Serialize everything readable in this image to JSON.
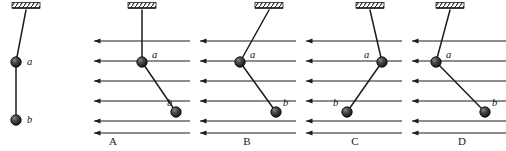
{
  "figure": {
    "type": "physics-diagram",
    "stroke_color": "#1d1d1d",
    "ball_color": "#2b2b2b",
    "ball_radius": 5.2,
    "field_arrow_color": "#1d1d1d"
  },
  "reference": {
    "name": "reference-figure",
    "ceiling": {
      "x1": 12,
      "x2": 40,
      "y": 8
    },
    "string_points": [
      [
        26,
        10
      ],
      [
        16,
        62
      ],
      [
        16,
        120
      ]
    ],
    "balls": [
      {
        "id": "a",
        "label": "a",
        "cx": 16,
        "cy": 62,
        "label_x": 27,
        "label_y": 57
      },
      {
        "id": "b",
        "label": "b",
        "cx": 16,
        "cy": 120,
        "label_x": 27,
        "label_y": 115
      }
    ]
  },
  "field": {
    "line_count": 6,
    "direction": "left",
    "rows_y": [
      41,
      61,
      81,
      101,
      121,
      133
    ]
  },
  "panels": [
    {
      "id": "A",
      "label": "A",
      "label_x": 93,
      "label_y": 136,
      "ceiling": {
        "x1": 128,
        "x2": 156,
        "y": 8
      },
      "string_points": [
        [
          142,
          10
        ],
        [
          142,
          62
        ],
        [
          176,
          112
        ]
      ],
      "balls": [
        {
          "id": "a",
          "label": "a",
          "cx": 142,
          "cy": 62,
          "label_x": 152,
          "label_y": 50
        },
        {
          "id": "b",
          "label": "b",
          "cx": 176,
          "cy": 112,
          "label_x": 167,
          "label_y": 98
        }
      ],
      "field_rows": [
        {
          "y": 41,
          "x_left": 88,
          "x_right": 190
        },
        {
          "y": 61,
          "x_left": 88,
          "x_right": 190
        },
        {
          "y": 81,
          "x_left": 88,
          "x_right": 190
        },
        {
          "y": 101,
          "x_left": 88,
          "x_right": 190
        },
        {
          "y": 121,
          "x_left": 88,
          "x_right": 190
        },
        {
          "y": 133,
          "x_left": 88,
          "x_right": 190
        }
      ]
    },
    {
      "id": "B",
      "label": "B",
      "label_x": 227,
      "label_y": 136,
      "ceiling": {
        "x1": 255,
        "x2": 283,
        "y": 8
      },
      "string_points": [
        [
          269,
          10
        ],
        [
          240,
          62
        ],
        [
          276,
          112
        ]
      ],
      "balls": [
        {
          "id": "a",
          "label": "a",
          "cx": 240,
          "cy": 62,
          "label_x": 250,
          "label_y": 50
        },
        {
          "id": "b",
          "label": "b",
          "cx": 276,
          "cy": 112,
          "label_x": 283,
          "label_y": 98
        }
      ],
      "field_rows": [
        {
          "y": 41,
          "x_left": 194,
          "x_right": 296
        },
        {
          "y": 61,
          "x_left": 194,
          "x_right": 296
        },
        {
          "y": 81,
          "x_left": 194,
          "x_right": 296
        },
        {
          "y": 101,
          "x_left": 194,
          "x_right": 296
        },
        {
          "y": 121,
          "x_left": 194,
          "x_right": 296
        },
        {
          "y": 133,
          "x_left": 194,
          "x_right": 296
        }
      ]
    },
    {
      "id": "C",
      "label": "C",
      "label_x": 335,
      "label_y": 136,
      "ceiling": {
        "x1": 356,
        "x2": 384,
        "y": 8
      },
      "string_points": [
        [
          370,
          10
        ],
        [
          382,
          62
        ],
        [
          347,
          112
        ]
      ],
      "balls": [
        {
          "id": "a",
          "label": "a",
          "cx": 382,
          "cy": 62,
          "label_x": 364,
          "label_y": 50
        },
        {
          "id": "b",
          "label": "b",
          "cx": 347,
          "cy": 112,
          "label_x": 333,
          "label_y": 98
        }
      ],
      "field_rows": [
        {
          "y": 41,
          "x_left": 300,
          "x_right": 402
        },
        {
          "y": 61,
          "x_left": 300,
          "x_right": 402
        },
        {
          "y": 81,
          "x_left": 300,
          "x_right": 402
        },
        {
          "y": 101,
          "x_left": 300,
          "x_right": 402
        },
        {
          "y": 121,
          "x_left": 300,
          "x_right": 402
        },
        {
          "y": 133,
          "x_left": 300,
          "x_right": 402
        }
      ]
    },
    {
      "id": "D",
      "label": "D",
      "label_x": 442,
      "label_y": 136,
      "ceiling": {
        "x1": 436,
        "x2": 464,
        "y": 8
      },
      "string_points": [
        [
          450,
          10
        ],
        [
          436,
          62
        ],
        [
          485,
          112
        ]
      ],
      "balls": [
        {
          "id": "a",
          "label": "a",
          "cx": 436,
          "cy": 62,
          "label_x": 446,
          "label_y": 50
        },
        {
          "id": "b",
          "label": "b",
          "cx": 485,
          "cy": 112,
          "label_x": 492,
          "label_y": 98
        }
      ],
      "field_rows": [
        {
          "y": 41,
          "x_left": 406,
          "x_right": 506
        },
        {
          "y": 61,
          "x_left": 406,
          "x_right": 506
        },
        {
          "y": 81,
          "x_left": 406,
          "x_right": 506
        },
        {
          "y": 101,
          "x_left": 406,
          "x_right": 506
        },
        {
          "y": 121,
          "x_left": 406,
          "x_right": 506
        },
        {
          "y": 133,
          "x_left": 406,
          "x_right": 506
        }
      ]
    }
  ]
}
